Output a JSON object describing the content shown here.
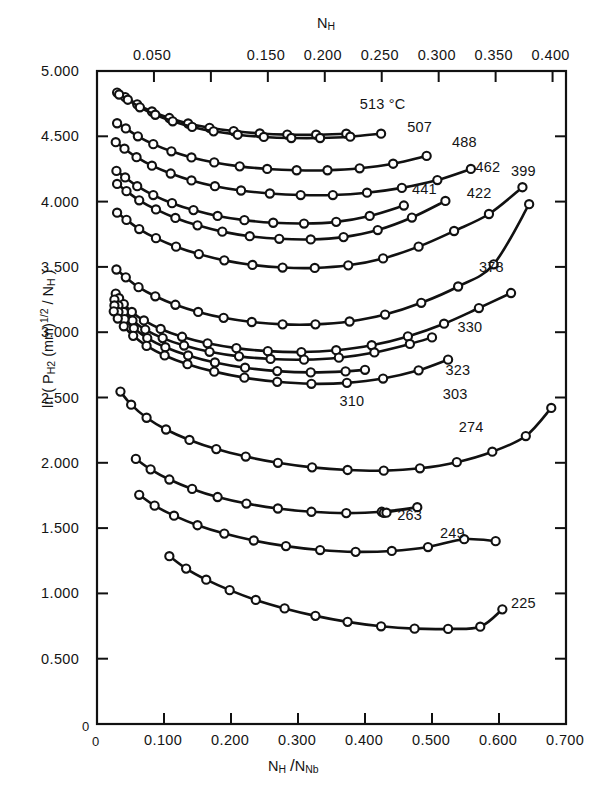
{
  "chart_data": {
    "type": "line",
    "title": "",
    "xlabel": "N_H / N_Nb",
    "ylabel": "ln ( P_H2 (mm)^1/2 / N_H )",
    "top_axis_label": "N_H",
    "xlim": [
      0,
      0.7
    ],
    "ylim": [
      0,
      5.0
    ],
    "top_xlim": [
      0,
      0.4118
    ],
    "grid": false,
    "legend": "inline end-of-curve labels",
    "x_ticks": [
      "0",
      "0.100",
      "0.200",
      "0.300",
      "0.400",
      "0.500",
      "0.600",
      "0.700"
    ],
    "x_tick_values": [
      0,
      0.1,
      0.2,
      0.3,
      0.4,
      0.5,
      0.6,
      0.7
    ],
    "y_ticks": [
      "0",
      "0.500",
      "1.000",
      "1.500",
      "2.000",
      "2.500",
      "3.000",
      "3.500",
      "4.000",
      "4.500",
      "5.000"
    ],
    "y_tick_values": [
      0,
      0.5,
      1.0,
      1.5,
      2.0,
      2.5,
      3.0,
      3.5,
      4.0,
      4.5,
      5.0
    ],
    "top_ticks": [
      "0.050",
      "0.150",
      "0.200",
      "0.250",
      "0.300",
      "0.350",
      "0.400"
    ],
    "top_tick_values": [
      0.05,
      0.15,
      0.2,
      0.25,
      0.3,
      0.35,
      0.4
    ],
    "units_note": "°C",
    "series": [
      {
        "name": "513 °C",
        "label": "513 °C",
        "label_x": 0.392,
        "label_y": 4.74,
        "x": [
          0.03,
          0.042,
          0.06,
          0.082,
          0.108,
          0.136,
          0.168,
          0.204,
          0.243,
          0.284,
          0.327,
          0.372
        ],
        "y": [
          4.835,
          4.8,
          4.745,
          4.69,
          4.64,
          4.598,
          4.565,
          4.54,
          4.522,
          4.513,
          4.512,
          4.52
        ]
      },
      {
        "name": "507",
        "label": "507",
        "label_x": 0.463,
        "label_y": 4.565,
        "x": [
          0.033,
          0.046,
          0.064,
          0.087,
          0.113,
          0.142,
          0.174,
          0.21,
          0.249,
          0.29,
          0.333,
          0.378,
          0.424
        ],
        "y": [
          4.82,
          4.78,
          4.722,
          4.665,
          4.615,
          4.572,
          4.538,
          4.512,
          4.495,
          4.487,
          4.487,
          4.497,
          4.52
        ]
      },
      {
        "name": "488",
        "label": "488",
        "label_x": 0.53,
        "label_y": 4.445,
        "x": [
          0.03,
          0.043,
          0.061,
          0.084,
          0.111,
          0.141,
          0.175,
          0.213,
          0.254,
          0.298,
          0.344,
          0.392,
          0.442,
          0.492
        ],
        "y": [
          4.6,
          4.56,
          4.5,
          4.44,
          4.385,
          4.338,
          4.3,
          4.27,
          4.25,
          4.24,
          4.24,
          4.255,
          4.29,
          4.35
        ]
      },
      {
        "name": "462",
        "label": "462",
        "label_x": 0.565,
        "label_y": 4.255,
        "x": [
          0.028,
          0.041,
          0.059,
          0.082,
          0.11,
          0.141,
          0.176,
          0.215,
          0.258,
          0.304,
          0.352,
          0.403,
          0.455,
          0.508,
          0.558
        ],
        "y": [
          4.455,
          4.405,
          4.34,
          4.275,
          4.215,
          4.162,
          4.118,
          4.085,
          4.062,
          4.05,
          4.05,
          4.068,
          4.105,
          4.165,
          4.25
        ]
      },
      {
        "name": "441",
        "label": "441",
        "label_x": 0.47,
        "label_y": 4.085,
        "x": [
          0.029,
          0.042,
          0.06,
          0.084,
          0.112,
          0.144,
          0.18,
          0.22,
          0.263,
          0.309,
          0.357,
          0.407,
          0.458
        ],
        "y": [
          4.235,
          4.185,
          4.118,
          4.05,
          3.988,
          3.935,
          3.89,
          3.858,
          3.838,
          3.832,
          3.845,
          3.89,
          3.97
        ]
      },
      {
        "name": "422",
        "label": "422",
        "label_x": 0.552,
        "label_y": 4.06,
        "x": [
          0.03,
          0.044,
          0.063,
          0.088,
          0.117,
          0.15,
          0.187,
          0.228,
          0.272,
          0.319,
          0.368,
          0.419,
          0.47,
          0.52
        ],
        "y": [
          4.135,
          4.08,
          4.01,
          3.94,
          3.875,
          3.818,
          3.77,
          3.735,
          3.715,
          3.71,
          3.728,
          3.782,
          3.878,
          4.005
        ]
      },
      {
        "name": "399",
        "label": "399",
        "label_x": 0.618,
        "label_y": 4.225,
        "x": [
          0.03,
          0.044,
          0.063,
          0.088,
          0.118,
          0.152,
          0.19,
          0.232,
          0.277,
          0.325,
          0.375,
          0.427,
          0.48,
          0.533,
          0.585,
          0.635
        ],
        "y": [
          3.915,
          3.86,
          3.79,
          3.72,
          3.655,
          3.598,
          3.55,
          3.515,
          3.495,
          3.492,
          3.512,
          3.565,
          3.655,
          3.775,
          3.905,
          4.11
        ]
      },
      {
        "name": "378",
        "label": "378",
        "label_x": 0.57,
        "label_y": 3.49,
        "x": [
          0.029,
          0.043,
          0.062,
          0.087,
          0.117,
          0.151,
          0.189,
          0.231,
          0.277,
          0.326,
          0.377,
          0.43,
          0.484,
          0.539,
          0.592,
          0.645
        ],
        "y": [
          3.48,
          3.42,
          3.345,
          3.275,
          3.21,
          3.155,
          3.11,
          3.078,
          3.06,
          3.06,
          3.082,
          3.135,
          3.225,
          3.35,
          3.52,
          3.98
        ]
      },
      {
        "name": "330",
        "label": "330",
        "label_x": 0.538,
        "label_y": 3.035,
        "x": [
          0.028,
          0.033,
          0.04,
          0.052,
          0.07,
          0.095,
          0.127,
          0.165,
          0.208,
          0.255,
          0.305,
          0.357,
          0.41,
          0.464,
          0.518,
          0.57,
          0.618
        ],
        "y": [
          3.295,
          3.26,
          3.215,
          3.155,
          3.09,
          3.025,
          2.965,
          2.915,
          2.878,
          2.855,
          2.848,
          2.862,
          2.9,
          2.968,
          3.065,
          3.185,
          3.3
        ]
      },
      {
        "name": "323",
        "label": "323",
        "label_x": 0.52,
        "label_y": 2.7,
        "x": [
          0.026,
          0.032,
          0.04,
          0.053,
          0.072,
          0.098,
          0.13,
          0.168,
          0.212,
          0.259,
          0.309,
          0.361,
          0.414,
          0.467,
          0.5
        ],
        "y": [
          3.25,
          3.205,
          3.155,
          3.09,
          3.02,
          2.955,
          2.898,
          2.85,
          2.815,
          2.795,
          2.79,
          2.805,
          2.845,
          2.91,
          2.96
        ]
      },
      {
        "name": "310",
        "label": "310",
        "label_x": 0.362,
        "label_y": 2.465,
        "x": [
          0.026,
          0.032,
          0.041,
          0.055,
          0.075,
          0.102,
          0.136,
          0.176,
          0.221,
          0.269,
          0.319,
          0.371,
          0.4
        ],
        "y": [
          3.205,
          3.155,
          3.1,
          3.03,
          2.955,
          2.885,
          2.822,
          2.768,
          2.728,
          2.702,
          2.692,
          2.7,
          2.712
        ]
      },
      {
        "name": "303",
        "label": "303",
        "label_x": 0.516,
        "label_y": 2.52,
        "x": [
          0.025,
          0.031,
          0.04,
          0.054,
          0.074,
          0.101,
          0.135,
          0.175,
          0.22,
          0.269,
          0.32,
          0.373,
          0.427,
          0.48,
          0.524
        ],
        "y": [
          3.16,
          3.105,
          3.045,
          2.972,
          2.895,
          2.822,
          2.755,
          2.698,
          2.652,
          2.62,
          2.605,
          2.612,
          2.645,
          2.708,
          2.79
        ]
      },
      {
        "name": "274",
        "label": "274",
        "label_x": 0.54,
        "label_y": 2.27,
        "x": [
          0.035,
          0.051,
          0.074,
          0.103,
          0.138,
          0.178,
          0.222,
          0.27,
          0.321,
          0.374,
          0.428,
          0.482,
          0.537,
          0.59,
          0.64,
          0.678
        ],
        "y": [
          2.545,
          2.445,
          2.345,
          2.255,
          2.175,
          2.105,
          2.048,
          2.0,
          1.965,
          1.945,
          1.94,
          1.958,
          2.005,
          2.085,
          2.205,
          2.42
        ]
      },
      {
        "name": "263",
        "label": "263",
        "label_x": 0.448,
        "label_y": 1.59,
        "x": [
          0.058,
          0.08,
          0.108,
          0.142,
          0.18,
          0.223,
          0.27,
          0.32,
          0.372,
          0.425,
          0.478,
          0.428,
          0.432
        ],
        "y": [
          2.03,
          1.95,
          1.872,
          1.8,
          1.738,
          1.688,
          1.65,
          1.625,
          1.615,
          1.625,
          1.66,
          1.617,
          1.618
        ]
      },
      {
        "name": "249",
        "label": "249",
        "label_x": 0.512,
        "label_y": 1.455,
        "x": [
          0.063,
          0.086,
          0.115,
          0.15,
          0.19,
          0.234,
          0.282,
          0.333,
          0.386,
          0.44,
          0.494,
          0.548,
          0.595
        ],
        "y": [
          1.755,
          1.672,
          1.595,
          1.522,
          1.458,
          1.405,
          1.362,
          1.332,
          1.318,
          1.325,
          1.355,
          1.415,
          1.4
        ]
      },
      {
        "name": "225",
        "label": "225",
        "label_x": 0.618,
        "label_y": 0.92,
        "x": [
          0.108,
          0.133,
          0.163,
          0.198,
          0.237,
          0.28,
          0.326,
          0.374,
          0.424,
          0.474,
          0.524,
          0.572,
          0.605
        ],
        "y": [
          1.285,
          1.19,
          1.105,
          1.025,
          0.95,
          0.885,
          0.828,
          0.782,
          0.748,
          0.73,
          0.728,
          0.745,
          0.878
        ]
      }
    ]
  },
  "axes": {
    "top_title": "N",
    "top_title_sub": "H",
    "bottom_title_num": "N",
    "bottom_title_num_sub": "H",
    "bottom_title_den": "N",
    "bottom_title_den_sub": "Nb",
    "y_title_pre": "ln ( P",
    "y_title_sub1": "H",
    "y_title_sub2": "2",
    "y_title_mid": " (mm)",
    "y_title_sup": "1/2",
    "y_title_post": " / N",
    "y_title_sub3": "H",
    "y_title_end": " )"
  },
  "style": {
    "line_color": "#111111",
    "marker_fill": "#ffffff",
    "background": "#ffffff"
  }
}
